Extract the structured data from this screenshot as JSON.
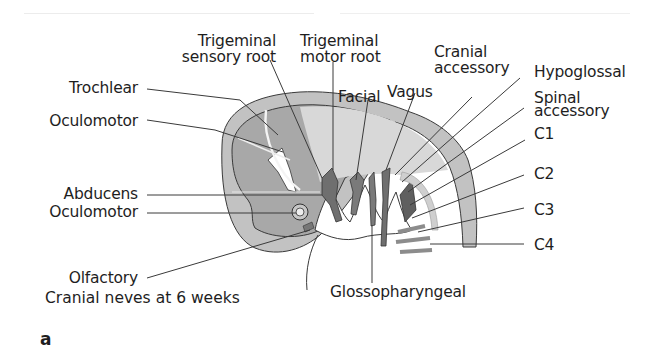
{
  "figure": {
    "caption": "Cranial neves at 6 weeks",
    "panel_label": "a"
  },
  "labels": {
    "trigeminal_sensory_root": [
      "Trigeminal",
      "sensory root"
    ],
    "trigeminal_motor_root": [
      "Trigeminal",
      "motor root"
    ],
    "trochlear": "Trochlear",
    "oculomotor_upper": "Oculomotor",
    "facial": "Facial",
    "vagus": "Vagus",
    "cranial_accessory": [
      "Cranial",
      "accessory"
    ],
    "hypoglossal": "Hypoglossal",
    "spinal_accessory": [
      "Spinal",
      "accessory"
    ],
    "c1": "C1",
    "c2": "C2",
    "c3": "C3",
    "c4": "C4",
    "abducens": "Abducens",
    "oculomotor_lower": "Oculomotor",
    "olfactory": "Olfactory",
    "glossopharyngeal": "Glossopharyngeal"
  },
  "colors": {
    "outer_layer": "#bdbdbd",
    "inner_brain": "#a9a9a9",
    "light_region": "#d6d6d6",
    "nerve_dark": "#6f6f6f",
    "leader_line": "#3a3a3a",
    "text": "#1e1e1e"
  }
}
